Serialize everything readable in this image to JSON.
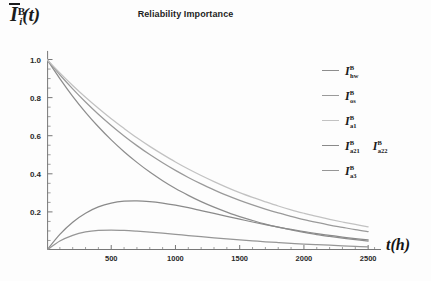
{
  "chart_data": {
    "type": "line",
    "title": "Reliability Importance",
    "xlabel": "t(h)",
    "ylabel": "Īᵢᴮ(t)",
    "ylabel_parts": {
      "base": "I",
      "sup": "B",
      "sub": "i",
      "tail": "(t)",
      "overbar": true
    },
    "xlim": [
      0,
      2600
    ],
    "ylim": [
      0,
      1.05
    ],
    "xticks": [
      500,
      1000,
      1500,
      2000,
      2500
    ],
    "xtick_labels": [
      "500",
      "1000",
      "1500",
      "2000",
      "2500"
    ],
    "yticks": [
      0.2,
      0.4,
      0.6,
      0.8,
      1.0
    ],
    "ytick_labels": [
      "0.2",
      "0.4",
      "0.6",
      "0.8",
      "1.0"
    ],
    "grid": false,
    "legend_position": "right",
    "x": [
      0,
      100,
      200,
      300,
      400,
      500,
      600,
      700,
      800,
      900,
      1000,
      1100,
      1200,
      1300,
      1400,
      1500,
      1600,
      1700,
      1800,
      1900,
      2000,
      2100,
      2200,
      2300,
      2400,
      2500
    ],
    "series": [
      {
        "name": "I_hw",
        "label_base": "I",
        "label_sup": "B",
        "label_sub": "hw",
        "color": "#8d8d8d",
        "values": [
          1.0,
          0.9,
          0.807,
          0.723,
          0.647,
          0.578,
          0.516,
          0.46,
          0.409,
          0.364,
          0.323,
          0.287,
          0.254,
          0.225,
          0.199,
          0.175,
          0.155,
          0.136,
          0.12,
          0.106,
          0.093,
          0.081,
          0.071,
          0.062,
          0.054,
          0.047
        ]
      },
      {
        "name": "I_os",
        "label_base": "I",
        "label_sup": "B",
        "label_sub": "os",
        "color": "#9a9a9a",
        "values": [
          1.0,
          0.92,
          0.846,
          0.777,
          0.713,
          0.654,
          0.599,
          0.548,
          0.501,
          0.458,
          0.418,
          0.381,
          0.347,
          0.316,
          0.287,
          0.261,
          0.237,
          0.215,
          0.195,
          0.177,
          0.16,
          0.145,
          0.131,
          0.119,
          0.107,
          0.097
        ]
      },
      {
        "name": "I_a1",
        "label_base": "I",
        "label_sup": "B",
        "label_sub": "a1",
        "color": "#c2c2c2",
        "values": [
          1.0,
          0.93,
          0.864,
          0.802,
          0.744,
          0.689,
          0.638,
          0.589,
          0.544,
          0.502,
          0.462,
          0.425,
          0.391,
          0.359,
          0.329,
          0.301,
          0.276,
          0.253,
          0.231,
          0.211,
          0.193,
          0.176,
          0.161,
          0.147,
          0.134,
          0.122
        ]
      },
      {
        "name": "I_a21_a22",
        "label_base": "I",
        "label_sup": "B",
        "label_sub": "a21",
        "label2_base": "I",
        "label2_sup": "B",
        "label2_sub": "a22",
        "color": "#8a8a8a",
        "values": [
          0.0,
          0.082,
          0.146,
          0.193,
          0.226,
          0.246,
          0.256,
          0.258,
          0.254,
          0.246,
          0.235,
          0.222,
          0.207,
          0.192,
          0.177,
          0.162,
          0.147,
          0.133,
          0.12,
          0.108,
          0.097,
          0.086,
          0.077,
          0.068,
          0.06,
          0.053
        ]
      },
      {
        "name": "I_a3",
        "label_base": "I",
        "label_sup": "B",
        "label_sub": "a3",
        "color": "#969696",
        "values": [
          0.0,
          0.047,
          0.077,
          0.095,
          0.103,
          0.105,
          0.103,
          0.099,
          0.094,
          0.088,
          0.082,
          0.076,
          0.07,
          0.064,
          0.058,
          0.053,
          0.048,
          0.043,
          0.039,
          0.035,
          0.031,
          0.028,
          0.025,
          0.022,
          0.019,
          0.017
        ]
      }
    ]
  },
  "axis": {
    "x_tick_color": "#2a2a2a",
    "y_tick_color": "#2a2a2a",
    "axis_line_color": "#777777"
  }
}
